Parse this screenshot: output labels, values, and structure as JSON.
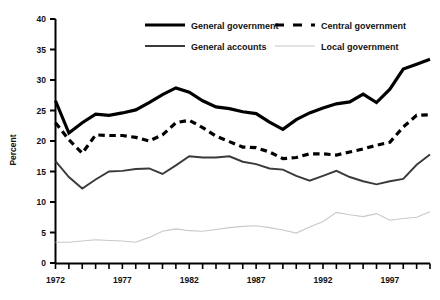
{
  "chart_data": {
    "type": "line",
    "title": "",
    "subtitle": "",
    "xlabel": "",
    "ylabel": "Percent",
    "ylim": [
      0,
      40
    ],
    "xlim": [
      1972,
      2000
    ],
    "yticks": [
      "0",
      "5",
      "10",
      "15",
      "20",
      "25",
      "30",
      "35",
      "40"
    ],
    "ytick_values": [
      0,
      5,
      10,
      15,
      20,
      25,
      30,
      35,
      40
    ],
    "xticks": [
      "1972",
      "1977",
      "1982",
      "1987",
      "1992",
      "1997"
    ],
    "xtick_values": [
      1972,
      1977,
      1982,
      1987,
      1992,
      1997
    ],
    "x": [
      1972,
      1973,
      1974,
      1975,
      1976,
      1977,
      1978,
      1979,
      1980,
      1981,
      1982,
      1983,
      1984,
      1985,
      1986,
      1987,
      1988,
      1989,
      1990,
      1991,
      1992,
      1993,
      1994,
      1995,
      1996,
      1997,
      1998,
      1999,
      2000
    ],
    "grid": false,
    "legend_position": "top",
    "series": [
      {
        "name": "General government",
        "style": "solid-thick",
        "color": "#000000",
        "values": [
          26.6,
          21.3,
          23.0,
          24.4,
          24.2,
          24.6,
          25.1,
          26.3,
          27.6,
          28.7,
          28.0,
          26.6,
          25.6,
          25.3,
          24.8,
          24.5,
          23.1,
          21.9,
          23.5,
          24.6,
          25.4,
          26.1,
          26.4,
          27.7,
          26.3,
          28.5,
          31.8,
          32.6,
          33.4
        ]
      },
      {
        "name": "Central government",
        "style": "dashed-thick",
        "color": "#000000",
        "values": [
          23.0,
          20.2,
          18.0,
          21.0,
          20.9,
          20.9,
          20.6,
          20.0,
          21.0,
          23.0,
          23.4,
          22.2,
          20.8,
          19.9,
          19.0,
          18.9,
          18.2,
          17.1,
          17.3,
          17.9,
          17.9,
          17.7,
          18.2,
          18.7,
          19.3,
          19.8,
          22.3,
          24.2,
          24.3
        ]
      },
      {
        "name": "General accounts",
        "style": "solid-medium",
        "color": "#3a3a3a",
        "values": [
          16.7,
          14.1,
          12.2,
          13.7,
          15.0,
          15.1,
          15.4,
          15.5,
          14.6,
          16.0,
          17.5,
          17.3,
          17.3,
          17.5,
          16.6,
          16.2,
          15.5,
          15.3,
          14.3,
          13.5,
          14.3,
          15.1,
          14.1,
          13.4,
          12.9,
          13.4,
          13.8,
          16.1,
          17.8
        ]
      },
      {
        "name": "Local government",
        "style": "solid-light",
        "color": "#c8c8c8",
        "values": [
          3.4,
          3.4,
          3.6,
          3.8,
          3.7,
          3.6,
          3.4,
          4.2,
          5.2,
          5.6,
          5.3,
          5.2,
          5.5,
          5.8,
          6.0,
          6.1,
          5.8,
          5.4,
          4.9,
          5.9,
          6.8,
          8.3,
          7.9,
          7.6,
          8.1,
          7.0,
          7.3,
          7.5,
          8.4
        ]
      }
    ]
  },
  "legend": {
    "items": [
      {
        "label": "General government",
        "style": "solid-thick"
      },
      {
        "label": "Central government",
        "style": "dashed-thick"
      },
      {
        "label": "General accounts",
        "style": "solid-medium"
      },
      {
        "label": "Local government",
        "style": "solid-light"
      }
    ]
  },
  "axes": {
    "y_title": "Percent"
  }
}
